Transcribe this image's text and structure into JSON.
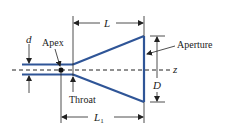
{
  "diagram": {
    "kind": "conical horn antenna cross-section",
    "labels": {
      "d": "d",
      "apex": "Apex",
      "throat": "Throat",
      "aperture": "Aperture",
      "L": "L",
      "L1_main": "L",
      "L1_sub": "1",
      "D": "D",
      "z": "z"
    },
    "colors": {
      "horn": "#2f5597",
      "annotation": "#222222"
    }
  }
}
